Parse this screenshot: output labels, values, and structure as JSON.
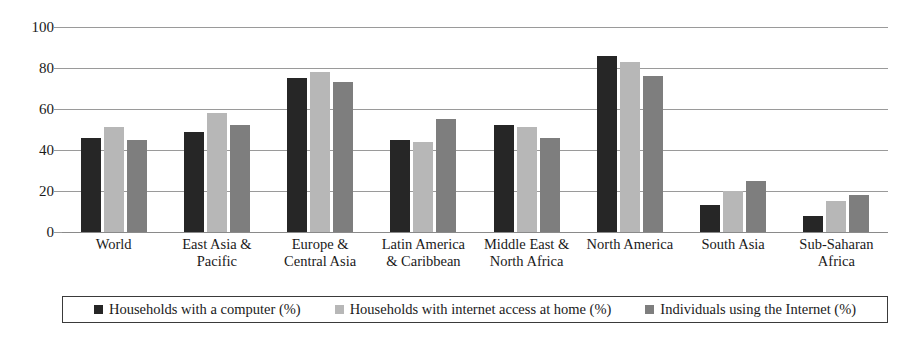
{
  "chart_data": {
    "type": "bar",
    "title": "",
    "subtitle": "",
    "xlabel": "",
    "ylabel": "",
    "ylim": [
      0,
      100
    ],
    "yticks": [
      0,
      20,
      40,
      60,
      80,
      100
    ],
    "grid": true,
    "legend_position": "bottom",
    "categories": [
      "World",
      "East Asia & Pacific",
      "Europe & Central Asia",
      "Latin America & Caribbean",
      "Middle East & North Africa",
      "North America",
      "South Asia",
      "Sub-Saharan Africa"
    ],
    "category_lines": [
      [
        "World"
      ],
      [
        "East Asia &",
        "Pacific"
      ],
      [
        "Europe &",
        "Central Asia"
      ],
      [
        "Latin America",
        "& Caribbean"
      ],
      [
        "Middle East &",
        "North Africa"
      ],
      [
        "North America"
      ],
      [
        "South Asia"
      ],
      [
        "Sub-Saharan",
        "Africa"
      ]
    ],
    "series": [
      {
        "name": "Households with a computer (%)",
        "color": "#262626",
        "values": [
          46,
          49,
          75,
          45,
          52,
          86,
          13,
          8
        ]
      },
      {
        "name": "Households with internet access at home (%)",
        "color": "#b7b7b7",
        "values": [
          51,
          58,
          78,
          44,
          51,
          83,
          20,
          15
        ]
      },
      {
        "name": "Individuals using the Internet (%)",
        "color": "#7e7e7e",
        "values": [
          45,
          52,
          73,
          55,
          46,
          76,
          25,
          18
        ]
      }
    ]
  },
  "legend": {
    "items": [
      {
        "label": "Households with a computer (%)",
        "color": "#262626"
      },
      {
        "label": "Households with internet access at home (%)",
        "color": "#b7b7b7"
      },
      {
        "label": "Individuals using the Internet (%)",
        "color": "#7e7e7e"
      }
    ]
  }
}
